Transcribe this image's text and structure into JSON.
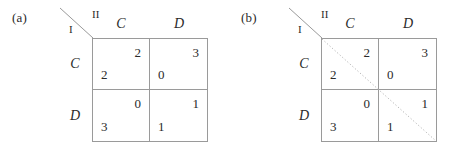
{
  "figure": {
    "panels": [
      {
        "label": "(a)",
        "corner": {
          "player_row": "I",
          "player_col": "II"
        },
        "column_headers": [
          "C",
          "D"
        ],
        "row_headers": [
          "C",
          "D"
        ],
        "diagonal": "none",
        "cells": [
          {
            "row": "C",
            "col": "C",
            "row_payoff": "2",
            "col_payoff": "2"
          },
          {
            "row": "C",
            "col": "D",
            "row_payoff": "0",
            "col_payoff": "3"
          },
          {
            "row": "D",
            "col": "C",
            "row_payoff": "3",
            "col_payoff": "0"
          },
          {
            "row": "D",
            "col": "D",
            "row_payoff": "1",
            "col_payoff": "1"
          }
        ]
      },
      {
        "label": "(b)",
        "corner": {
          "player_row": "I",
          "player_col": "II"
        },
        "column_headers": [
          "C",
          "D"
        ],
        "row_headers": [
          "C",
          "D"
        ],
        "diagonal": "dotted-main",
        "cells": [
          {
            "row": "C",
            "col": "C",
            "row_payoff": "2",
            "col_payoff": "2"
          },
          {
            "row": "C",
            "col": "D",
            "row_payoff": "0",
            "col_payoff": "3"
          },
          {
            "row": "D",
            "col": "C",
            "row_payoff": "3",
            "col_payoff": "0"
          },
          {
            "row": "D",
            "col": "D",
            "row_payoff": "1",
            "col_payoff": "1"
          }
        ]
      }
    ],
    "colors": {
      "grid_line": "#9a9a9a",
      "text": "#2a2a2a",
      "diagonal_line": "#b4b4b4",
      "background": "#ffffff"
    }
  }
}
